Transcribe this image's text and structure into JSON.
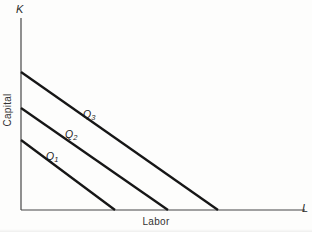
{
  "figure": {
    "background_color": "#fdfdfc",
    "axis_color": "#474747",
    "axis_stroke_width": 1.2,
    "isoquant_color": "#161616",
    "isoquant_stroke_width": 2.3,
    "text_color": "#222222"
  },
  "chart_data": {
    "type": "line",
    "title": "",
    "xlabel": "Labor",
    "ylabel": "Capital",
    "x_axis_end_label": "L",
    "y_axis_end_label": "K",
    "grid": false,
    "legend": false,
    "axes_px": {
      "origin": [
        21,
        210
      ],
      "x_end": [
        305,
        210
      ],
      "y_end": [
        21,
        18
      ]
    },
    "series": [
      {
        "name": "Q1",
        "label_base": "Q",
        "label_sub": "1",
        "start_px": [
          21,
          140
        ],
        "end_px": [
          115,
          210
        ],
        "k_intercept_fraction": 0.365,
        "l_intercept_fraction": 0.331
      },
      {
        "name": "Q2",
        "label_base": "Q",
        "label_sub": "2",
        "start_px": [
          21,
          108
        ],
        "end_px": [
          168,
          210
        ],
        "k_intercept_fraction": 0.531,
        "l_intercept_fraction": 0.517
      },
      {
        "name": "Q3",
        "label_base": "Q",
        "label_sub": "3",
        "start_px": [
          21,
          72
        ],
        "end_px": [
          218,
          210
        ],
        "k_intercept_fraction": 0.719,
        "l_intercept_fraction": 0.694
      }
    ]
  }
}
